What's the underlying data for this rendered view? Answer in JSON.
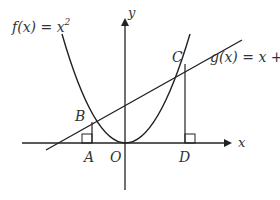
{
  "diagram": {
    "type": "function-graph",
    "functions": [
      {
        "name": "f",
        "expression": "f(x) = x^2",
        "label_fn": "f",
        "label_var": "x",
        "label_rhs": "x",
        "label_exp": "2"
      },
      {
        "name": "g",
        "expression": "g(x) = x + 2",
        "label_fn": "g",
        "label_var": "x",
        "label_rhs": "x + 2"
      }
    ],
    "axes": {
      "x_label": "x",
      "y_label": "y",
      "origin_label": "O"
    },
    "points": [
      {
        "name": "A",
        "label": "A",
        "coords": [
          -1,
          0
        ]
      },
      {
        "name": "B",
        "label": "B",
        "coords": [
          -1,
          1
        ]
      },
      {
        "name": "C",
        "label": "C",
        "coords": [
          2,
          4
        ]
      },
      {
        "name": "D",
        "label": "D",
        "coords": [
          2,
          0
        ]
      },
      {
        "name": "O",
        "label": "O",
        "coords": [
          0,
          0
        ]
      }
    ],
    "right_angle_marks": [
      "A",
      "D"
    ],
    "colors": {
      "stroke": "#222222",
      "text": "#333333",
      "background": "#ffffff"
    }
  }
}
